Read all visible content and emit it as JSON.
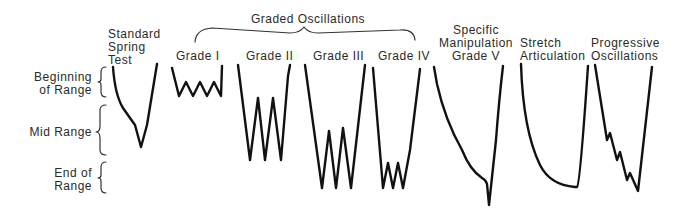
{
  "diagram": {
    "title": "Graded Oscillations",
    "range_labels": [
      {
        "id": "beginning",
        "text": "Beginning\nof Range"
      },
      {
        "id": "mid",
        "text": "Mid Range"
      },
      {
        "id": "end",
        "text": "End of\nRange"
      }
    ],
    "techniques": [
      {
        "id": "standard-spring-test",
        "label": "Standard\nSpring\nTest"
      },
      {
        "id": "grade-1",
        "label": "Grade I"
      },
      {
        "id": "grade-2",
        "label": "Grade II"
      },
      {
        "id": "grade-3",
        "label": "Grade III"
      },
      {
        "id": "grade-4",
        "label": "Grade IV"
      },
      {
        "id": "grade-5",
        "label": "Specific\nManipulation\nGrade V"
      },
      {
        "id": "stretch-articulation",
        "label": "Stretch\nArticulation"
      },
      {
        "id": "progressive-oscillations",
        "label": "Progressive\nOscillations"
      }
    ]
  }
}
